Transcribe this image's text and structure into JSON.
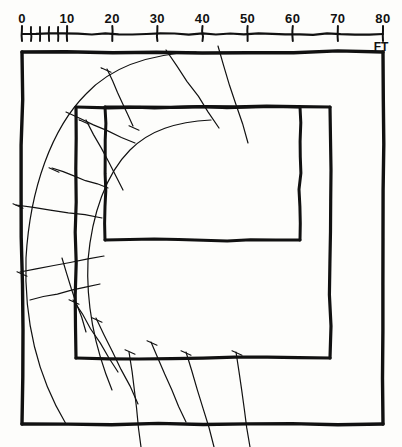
{
  "drawing": {
    "title": "Hand-drawn site plan with scale bar",
    "background_color": "#fdfdfb",
    "ink_color": "#111111"
  },
  "scale_bar": {
    "name": "scale-bar",
    "unit_label": "FT",
    "min": 0,
    "max": 80,
    "major_interval": 10,
    "minor_interval": 2,
    "minor_range_end": 10,
    "labels": [
      "0",
      "10",
      "20",
      "30",
      "40",
      "50",
      "60",
      "70",
      "80"
    ],
    "label_values": [
      0,
      10,
      20,
      30,
      40,
      50,
      60,
      70,
      80
    ],
    "x_start_px": 22,
    "x_end_px": 383,
    "baseline_y_px": 34
  },
  "plan": {
    "outer_rectangle": {
      "name": "outer-wall",
      "x1": 22,
      "y1": 52,
      "x2": 383,
      "y2": 424,
      "stroke_width": 3.4
    },
    "middle_rectangle": {
      "name": "middle-wall",
      "x1": 76,
      "y1": 107,
      "x2": 330,
      "y2": 358,
      "stroke_width": 3.2
    },
    "inner_rectangle": {
      "name": "inner-wall",
      "x1": 105,
      "y1": 107,
      "x2": 300,
      "y2": 240,
      "stroke_width": 3.0
    },
    "arcs": {
      "name": "concentric-arcs",
      "count": 2,
      "stroke_width": 1.2,
      "outer_arc_path": "M 196 52 C 150 54 112 66 86 94 C 52 128 30 188 26 258 C 24 318 36 374 66 424",
      "inner_arc_path": "M 211 120 C 176 122 150 130 130 150 C 106 174 92 214 88 260 C 86 302 94 346 112 390"
    },
    "radial_lines": {
      "name": "radial-tick-lines",
      "stroke_width": 1.2,
      "segments": [
        {
          "x1": 166,
          "y1": 50,
          "x2": 219,
          "y2": 128
        },
        {
          "x1": 218,
          "y1": 46,
          "x2": 248,
          "y2": 143
        },
        {
          "x1": 107,
          "y1": 69,
          "x2": 133,
          "y2": 126
        },
        {
          "x1": 66,
          "y1": 112,
          "x2": 135,
          "y2": 143
        },
        {
          "x1": 86,
          "y1": 120,
          "x2": 123,
          "y2": 190
        },
        {
          "x1": 52,
          "y1": 168,
          "x2": 108,
          "y2": 188
        },
        {
          "x1": 16,
          "y1": 205,
          "x2": 102,
          "y2": 218
        },
        {
          "x1": 20,
          "y1": 272,
          "x2": 104,
          "y2": 256
        },
        {
          "x1": 30,
          "y1": 300,
          "x2": 100,
          "y2": 284
        },
        {
          "x1": 62,
          "y1": 258,
          "x2": 86,
          "y2": 332
        },
        {
          "x1": 73,
          "y1": 300,
          "x2": 118,
          "y2": 372
        },
        {
          "x1": 96,
          "y1": 318,
          "x2": 138,
          "y2": 404
        },
        {
          "x1": 129,
          "y1": 352,
          "x2": 141,
          "y2": 447
        },
        {
          "x1": 151,
          "y1": 342,
          "x2": 186,
          "y2": 422
        },
        {
          "x1": 186,
          "y1": 352,
          "x2": 214,
          "y2": 447
        },
        {
          "x1": 236,
          "y1": 352,
          "x2": 250,
          "y2": 447
        }
      ]
    },
    "cross_marks": {
      "name": "arc-cross-marks",
      "points": [
        {
          "x": 106,
          "y": 70
        },
        {
          "x": 134,
          "y": 128
        },
        {
          "x": 84,
          "y": 122
        },
        {
          "x": 54,
          "y": 170
        },
        {
          "x": 18,
          "y": 206
        },
        {
          "x": 22,
          "y": 274
        },
        {
          "x": 74,
          "y": 302
        },
        {
          "x": 97,
          "y": 320
        },
        {
          "x": 130,
          "y": 352
        },
        {
          "x": 152,
          "y": 343
        },
        {
          "x": 186,
          "y": 353
        },
        {
          "x": 237,
          "y": 353
        }
      ]
    }
  }
}
